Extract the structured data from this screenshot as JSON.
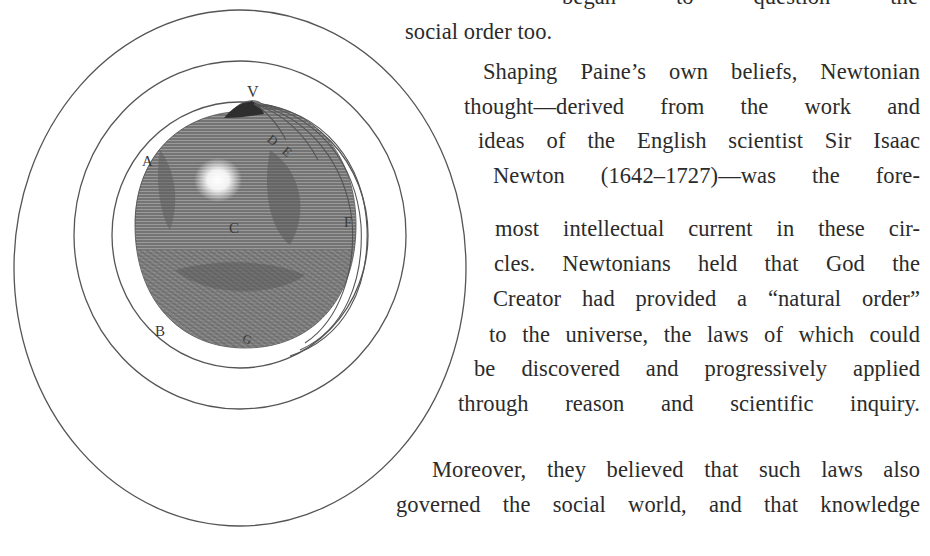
{
  "figure": {
    "labels": {
      "V": "V",
      "A": "A",
      "B": "B",
      "C": "C",
      "D": "D",
      "E": "E",
      "F": "F",
      "G": "G"
    }
  },
  "text": {
    "lines": [
      "began to question the",
      "social order too.",
      "Shaping Paine’s own beliefs, Newtonian",
      "thought—derived from the work and",
      "ideas of the English scientist Sir Isaac",
      "Newton (1642–1727)—was the fore-",
      "most intellectual current in these cir-",
      "cles. Newtonians held that God the",
      "Creator had provided a “natural order”",
      "to the universe, the laws of which could",
      "be discovered and progressively applied",
      "through reason and scientific inquiry.",
      "Moreover, they believed that such laws also",
      "governed the social world, and that knowledge"
    ]
  }
}
